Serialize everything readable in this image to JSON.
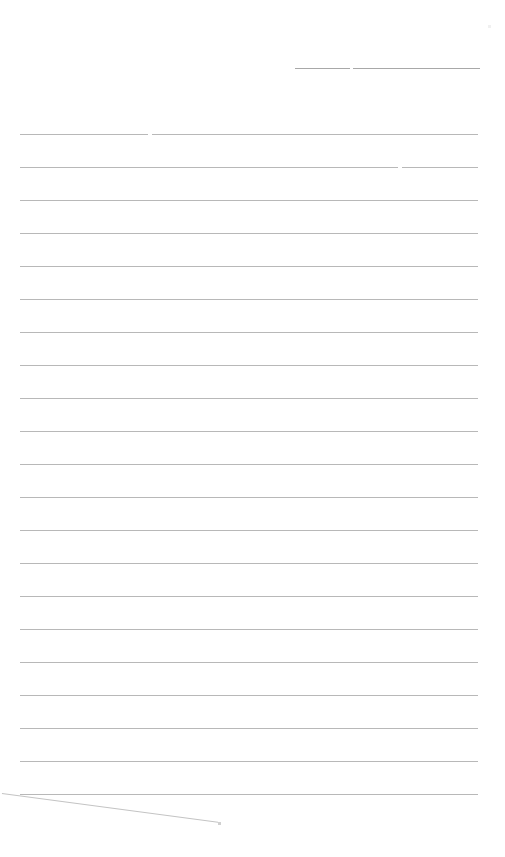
{
  "document": {
    "type": "blank lined form page",
    "background": "#ffffff",
    "line_color": "#b8b8b8",
    "header_line": {
      "y": 68,
      "segments": [
        [
          295,
          350
        ],
        [
          353,
          480
        ]
      ]
    },
    "ruled_lines": {
      "count": 21,
      "first_y": 134,
      "spacing": 33,
      "x_start": 20,
      "x_end": 478,
      "line_1_break_x": 150,
      "line_2_break_x": 400
    },
    "text": []
  }
}
